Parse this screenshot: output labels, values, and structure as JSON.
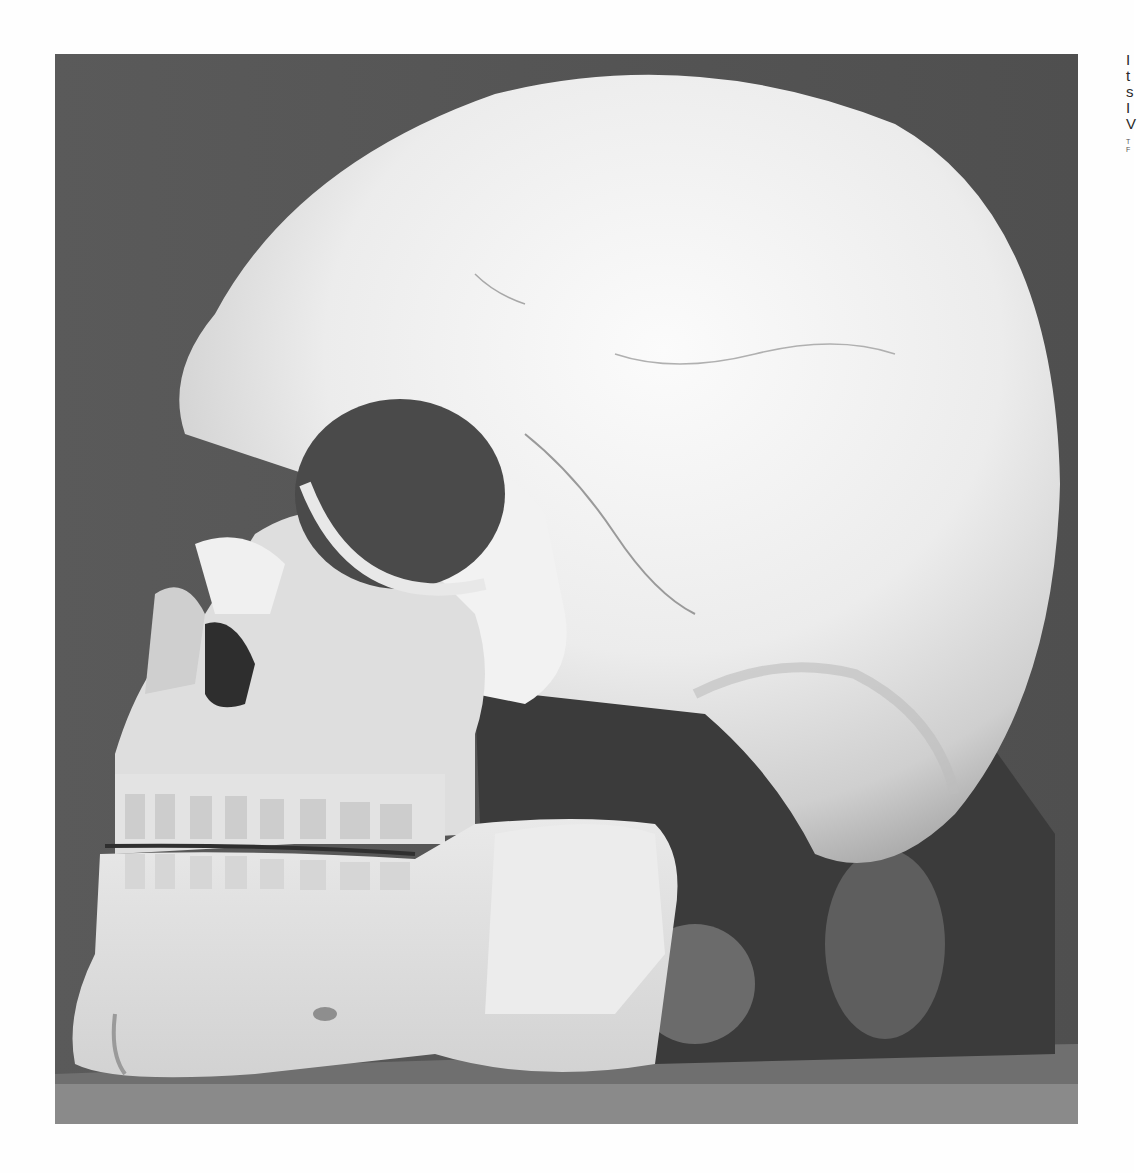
{
  "figure": {
    "colors": {
      "background": "#565656",
      "table_surface": "#8a8a8a",
      "bone_highlight": "#f4f4f4",
      "bone_mid": "#c8c8c8",
      "shadow": "#3a3a3a"
    }
  },
  "caption": {
    "lines": [
      "I",
      "t",
      "s",
      "I",
      "V"
    ],
    "small_lines": [
      "T",
      "F"
    ]
  }
}
